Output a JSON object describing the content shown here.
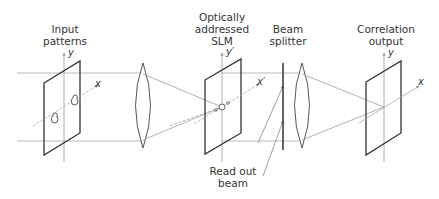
{
  "diagram": {
    "labels": {
      "input": [
        "Input",
        "patterns"
      ],
      "slm": [
        "Optically",
        "addressed",
        "SLM"
      ],
      "beam_splitter": [
        "Beam",
        "splitter"
      ],
      "output": [
        "Correlation",
        "output"
      ],
      "read_out": [
        "Read out",
        "beam"
      ]
    },
    "axes": {
      "input_y": "y",
      "input_x": "x",
      "slm_y": "y′",
      "slm_x": "x′",
      "output_y": "y",
      "output_x": "x"
    },
    "colors": {
      "plane_stroke": "#333333",
      "beam_stroke": "#a0a0a0",
      "axis_stroke": "#999999",
      "text": "#333333"
    }
  }
}
